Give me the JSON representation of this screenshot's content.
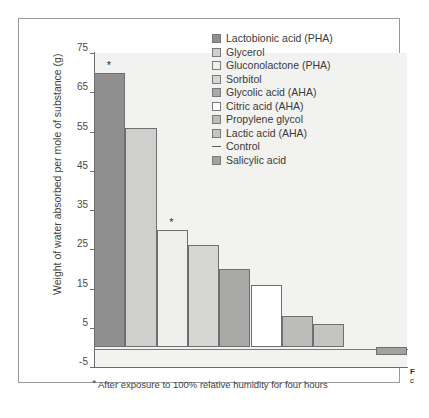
{
  "figure": {
    "footnote_star": "*",
    "footnote_text": "After exposure to 100% relative humidity for four hours",
    "caption_line1": "F",
    "caption_line2": "c"
  },
  "chart_data": {
    "type": "bar",
    "title": "",
    "xlabel": "",
    "ylabel": "Weight of water absorbed per mole of substance (g)",
    "ylim": [
      -5,
      75
    ],
    "yticks": [
      75,
      65,
      55,
      45,
      35,
      25,
      15,
      5,
      -5
    ],
    "grid": false,
    "legend_position": "upper-right inside plot",
    "categories": [
      "Lactobionic acid (PHA)",
      "Glycerol",
      "Gluconolactone (PHA)",
      "Sorbitol",
      "Glycolic acid (AHA)",
      "Citric acid (AHA)",
      "Propylene glycol",
      "Lactic acid (AHA)",
      "Control",
      "Salicylic acid"
    ],
    "values": [
      70,
      56,
      30,
      26,
      20,
      16,
      8,
      6,
      0,
      -2
    ],
    "colors": [
      "#8f8f8f",
      "#cfcfcd",
      "#efefed",
      "#d6d6d4",
      "#a9a9a7",
      "#ffffff",
      "#bcbcba",
      "#c4c4c2",
      "#f2f2f0",
      "#a2a2a0"
    ],
    "annotations": [
      {
        "series_index": 0,
        "text": "*"
      },
      {
        "series_index": 2,
        "text": "*"
      }
    ]
  },
  "legend": {
    "items": [
      {
        "label": "Lactobionic acid (PHA)",
        "swatch": "#8f8f8f",
        "marker": "square"
      },
      {
        "label": "Glycerol",
        "swatch": "#cfcfcd",
        "marker": "square"
      },
      {
        "label": "Gluconolactone (PHA)",
        "swatch": "#efefed",
        "marker": "square"
      },
      {
        "label": "Sorbitol",
        "swatch": "#d6d6d4",
        "marker": "square"
      },
      {
        "label": "Glycolic acid (AHA)",
        "swatch": "#a9a9a7",
        "marker": "square"
      },
      {
        "label": "Citric acid (AHA)",
        "swatch": "#ffffff",
        "marker": "square"
      },
      {
        "label": "Propylene glycol",
        "swatch": "#bcbcba",
        "marker": "square"
      },
      {
        "label": "Lactic acid (AHA)",
        "swatch": "#c4c4c2",
        "marker": "square"
      },
      {
        "label": "Control",
        "swatch": "#5d5d5d",
        "marker": "dash"
      },
      {
        "label": "Salicylic acid",
        "swatch": "#a2a2a0",
        "marker": "square"
      }
    ]
  }
}
